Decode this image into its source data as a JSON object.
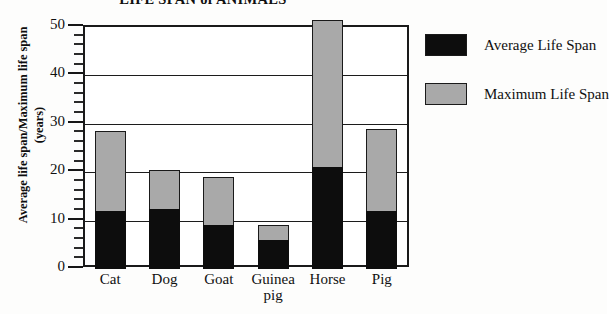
{
  "chart_data": {
    "type": "bar",
    "subtype": "stacked-overlay",
    "title": "LIFE SPAN of ANIMALS",
    "xlabel": "",
    "ylabel": "Average life span/Maximum life span (years)",
    "ylabel_line1": "Average life span/Maximum life span",
    "ylabel_line2": "(years)",
    "ylim": [
      0,
      50
    ],
    "ytick_values": [
      0,
      10,
      20,
      30,
      40,
      50
    ],
    "ytick_labels": [
      "0",
      "10",
      "20",
      "30",
      "40",
      "50"
    ],
    "yminor_step": 2,
    "grid": "horizontal",
    "legend_position": "right",
    "categories": [
      "Cat",
      "Dog",
      "Goat",
      "Guinea pig",
      "Horse",
      "Pig"
    ],
    "category_lines": [
      [
        "Cat"
      ],
      [
        "Dog"
      ],
      [
        "Goat"
      ],
      [
        "Guinea",
        "pig"
      ],
      [
        "Horse"
      ],
      [
        "Pig"
      ]
    ],
    "series": [
      {
        "name": "Average Life Span",
        "color": "#0d0d0d",
        "values": [
          12,
          12.5,
          9,
          6,
          21,
          12
        ]
      },
      {
        "name": "Maximum Life Span",
        "color": "#a9a9a9",
        "values": [
          28.5,
          20.5,
          19,
          9,
          51.5,
          29
        ]
      }
    ]
  },
  "legend": {
    "items": [
      {
        "label": "Average Life Span",
        "color": "#0d0d0d"
      },
      {
        "label": "Maximum Life Span",
        "color": "#a9a9a9"
      }
    ]
  }
}
